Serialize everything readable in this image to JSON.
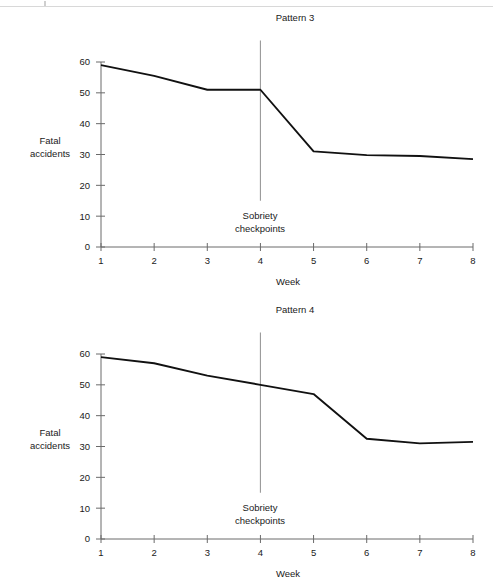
{
  "page": {
    "background_color": "#ffffff",
    "scan_artifact": true
  },
  "charts": [
    {
      "id": "pattern-3",
      "chart_data": {
        "type": "line",
        "title": "Pattern 3",
        "xlabel": "Week",
        "ylabel": "Fatal\naccidents",
        "ylabel_line1": "Fatal",
        "ylabel_line2": "accidents",
        "x": [
          1,
          2,
          3,
          4,
          5,
          6,
          7,
          8
        ],
        "xticklabels": [
          "1",
          "2",
          "3",
          "4",
          "5",
          "6",
          "7",
          "8"
        ],
        "yticks": [
          0,
          10,
          20,
          30,
          40,
          50,
          60
        ],
        "yticklabels": [
          "0",
          "10",
          "20",
          "30",
          "40",
          "50",
          "60"
        ],
        "xlim": [
          1,
          8
        ],
        "ylim": [
          0,
          60
        ],
        "grid": false,
        "legend": "none",
        "series": [
          {
            "name": "Fatal accidents",
            "color": "#111111",
            "values": [
              59,
              55.5,
              51,
              51,
              31,
              29.8,
              29.5,
              28.5
            ]
          }
        ],
        "annotations": [
          {
            "type": "vline",
            "x": 4,
            "y_from": 15,
            "y_to": 67,
            "color": "#9a9a9a",
            "label_line1": "Sobriety",
            "label_line2": "checkpoints"
          }
        ]
      }
    },
    {
      "id": "pattern-4",
      "chart_data": {
        "type": "line",
        "title": "Pattern 4",
        "xlabel": "Week",
        "ylabel": "Fatal\naccidents",
        "ylabel_line1": "Fatal",
        "ylabel_line2": "accidents",
        "x": [
          1,
          2,
          3,
          4,
          5,
          6,
          7,
          8
        ],
        "xticklabels": [
          "1",
          "2",
          "3",
          "4",
          "5",
          "6",
          "7",
          "8"
        ],
        "yticks": [
          0,
          10,
          20,
          30,
          40,
          50,
          60
        ],
        "yticklabels": [
          "0",
          "10",
          "20",
          "30",
          "40",
          "50",
          "60"
        ],
        "xlim": [
          1,
          8
        ],
        "ylim": [
          0,
          60
        ],
        "grid": false,
        "legend": "none",
        "series": [
          {
            "name": "Fatal accidents",
            "color": "#111111",
            "values": [
              59,
              57,
              53,
              50,
              47,
              32.5,
              31,
              31.5
            ]
          }
        ],
        "annotations": [
          {
            "type": "vline",
            "x": 4,
            "y_from": 15,
            "y_to": 67,
            "color": "#9a9a9a",
            "label_line1": "Sobriety",
            "label_line2": "checkpoints"
          }
        ]
      }
    }
  ]
}
